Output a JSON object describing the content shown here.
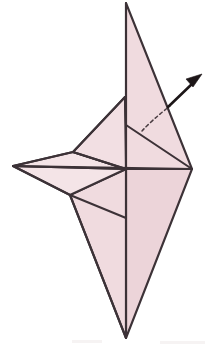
{
  "figure": {
    "caption": "",
    "background_color": "#ffffff"
  },
  "palette": {
    "paper_fill": "#f0dbdf",
    "paper_fill_shade": "#ecd4d9",
    "paper_fill_light": "#f4e4e7",
    "outline_color": "#3c3237",
    "crease_color": "#3c3237",
    "hidden_crease_color": "#4a3d42",
    "arrow_color": "#1d1618",
    "smudge_color": "#efeaea"
  },
  "canvas": {
    "width": 210,
    "height": 346,
    "viewbox": "0 0 210 346"
  },
  "vertices": {
    "top_apex": "126,3",
    "bottom_apex": "126,338",
    "left_point": "13,166",
    "right_vertex": "192,169",
    "center_cross": "126,169",
    "upper_left_corner": "125,97",
    "mid_left_upper": "73,152",
    "mid_left_lower": "70,195",
    "spine_upper_mid": "126,125",
    "spine_lower_mid": "126,218",
    "right_top_edge": "182,126"
  },
  "shapes": {
    "upper_right_blade": {
      "name": "upper-right-blade",
      "points": "126,3 192,169 126,169",
      "fill_ref": "paper_fill"
    },
    "lower_right_blade": {
      "name": "lower-right-blade",
      "points": "126,169 192,169 126,338",
      "fill_ref": "paper_fill_shade"
    },
    "lower_left_blade": {
      "name": "lower-left-blade",
      "points": "126,169 126,338 70,195",
      "fill_ref": "paper_fill"
    },
    "left_upper_wing": {
      "name": "left-upper-wing",
      "points": "13,166 73,152 126,169",
      "fill_ref": "paper_fill_light"
    },
    "left_lower_wing": {
      "name": "left-lower-wing",
      "points": "13,166 126,169 70,195",
      "fill_ref": "paper_fill"
    },
    "upper_left_flap": {
      "name": "upper-left-flap",
      "points": "125,97 73,152 126,169",
      "fill_ref": "paper_fill_light"
    }
  },
  "creases": {
    "vertical_spine": {
      "name": "vertical-spine-crease",
      "path": "M126,3 L126,338"
    },
    "horizontal_crease": {
      "name": "horizontal-crease",
      "path": "M13,166 L192,169"
    },
    "upper_left_fold": {
      "name": "upper-left-fold-crease",
      "path": "M125,97 L73,152"
    },
    "left_wing_upper_edge": {
      "name": "left-wing-upper-edge",
      "path": "M73,152 L126,169"
    },
    "left_wing_lower_edge": {
      "name": "left-wing-lower-edge",
      "path": "M70,195 L126,218"
    },
    "diagonal_to_right": {
      "name": "diagonal-right-crease",
      "path": "M126,125 L192,169"
    },
    "left_point_upper_outline": {
      "name": "left-point-upper-outline",
      "path": "M13,166 L73,152"
    },
    "left_point_lower_outline": {
      "name": "left-point-lower-outline",
      "path": "M13,166 L70,195"
    },
    "lower_left_outline": {
      "name": "lower-left-outline",
      "path": "M70,195 L126,338"
    },
    "upper_left_outline": {
      "name": "upper-left-outline",
      "path": "M125,97 L126,125"
    }
  },
  "hidden_crease": {
    "name": "hidden-arc-crease",
    "label": "dashed arc",
    "path": "M142,131 Q152,120 170,106"
  },
  "fold_arrow": {
    "name": "fold-direction-arrow",
    "label": "unfold to the upper right",
    "shaft_path": "M168,107 L193,83",
    "head_points": "202,74 186,79 193,87",
    "direction": "up-right"
  },
  "smudges": [
    {
      "name": "scan-smudge-left",
      "x": 72,
      "y": 340,
      "width": 30,
      "height": 3
    },
    {
      "name": "scan-smudge-right",
      "x": 160,
      "y": 341,
      "width": 45,
      "height": 3
    }
  ]
}
